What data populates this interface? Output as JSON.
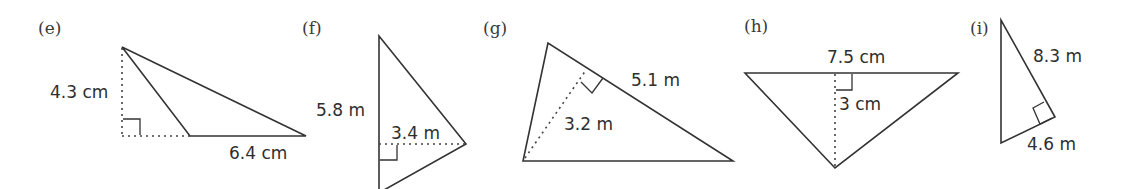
{
  "figures": [
    {
      "id": "e",
      "label": "(e)",
      "height_label": "4.3 cm",
      "base_label": "6.4 cm",
      "shape": "obtuse triangle with external perpendicular height"
    },
    {
      "id": "f",
      "label": "(f)",
      "base_label": "5.8 m",
      "height_label": "3.4 m",
      "shape": "triangle with vertical base and horizontal height"
    },
    {
      "id": "g",
      "label": "(g)",
      "base_label": "5.1 m",
      "height_label": "3.2 m",
      "shape": "triangle with altitude to slanted side"
    },
    {
      "id": "h",
      "label": "(h)",
      "base_label": "7.5 cm",
      "height_label": "3 cm",
      "shape": "inverted triangle with vertical altitude"
    },
    {
      "id": "i",
      "label": "(i)",
      "base_label": "8.3 m",
      "height_label": "4.6 m",
      "shape": "right triangle"
    }
  ],
  "colors": {
    "line": "#333333",
    "text": "#2e2e2e",
    "background": "#ffffff"
  }
}
